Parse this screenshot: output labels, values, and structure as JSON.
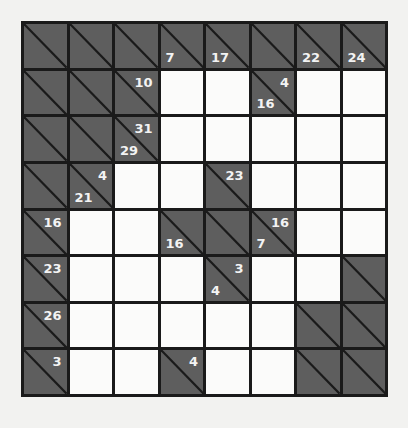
{
  "puzzle": {
    "type": "kakuro",
    "rows": 8,
    "cols": 8,
    "colors": {
      "block": "#5e5e5e",
      "white": "#fbfbfa",
      "grid": "#1a1a1a",
      "clue_text": "#f3f3f3"
    },
    "grid": [
      [
        {
          "t": "block"
        },
        {
          "t": "block"
        },
        {
          "t": "block"
        },
        {
          "t": "block",
          "down": "7"
        },
        {
          "t": "block",
          "down": "17"
        },
        {
          "t": "block"
        },
        {
          "t": "block",
          "down": "22"
        },
        {
          "t": "block",
          "down": "24"
        }
      ],
      [
        {
          "t": "block"
        },
        {
          "t": "block"
        },
        {
          "t": "block",
          "right": "10"
        },
        {
          "t": "white"
        },
        {
          "t": "white"
        },
        {
          "t": "block",
          "right": "4",
          "down": "16"
        },
        {
          "t": "white"
        },
        {
          "t": "white"
        }
      ],
      [
        {
          "t": "block"
        },
        {
          "t": "block"
        },
        {
          "t": "block",
          "right": "31",
          "down": "29"
        },
        {
          "t": "white"
        },
        {
          "t": "white"
        },
        {
          "t": "white"
        },
        {
          "t": "white"
        },
        {
          "t": "white"
        }
      ],
      [
        {
          "t": "block"
        },
        {
          "t": "block",
          "right": "4",
          "down": "21"
        },
        {
          "t": "white"
        },
        {
          "t": "white"
        },
        {
          "t": "block",
          "right": "23"
        },
        {
          "t": "white"
        },
        {
          "t": "white"
        },
        {
          "t": "white"
        }
      ],
      [
        {
          "t": "block",
          "right": "16"
        },
        {
          "t": "white"
        },
        {
          "t": "white"
        },
        {
          "t": "block",
          "down": "16"
        },
        {
          "t": "block"
        },
        {
          "t": "block",
          "right": "16",
          "down": "7"
        },
        {
          "t": "white"
        },
        {
          "t": "white"
        }
      ],
      [
        {
          "t": "block",
          "right": "23"
        },
        {
          "t": "white"
        },
        {
          "t": "white"
        },
        {
          "t": "white"
        },
        {
          "t": "block",
          "right": "3",
          "down": "4"
        },
        {
          "t": "white"
        },
        {
          "t": "white"
        },
        {
          "t": "block"
        }
      ],
      [
        {
          "t": "block",
          "right": "26"
        },
        {
          "t": "white"
        },
        {
          "t": "white"
        },
        {
          "t": "white"
        },
        {
          "t": "white"
        },
        {
          "t": "white"
        },
        {
          "t": "block"
        },
        {
          "t": "block"
        }
      ],
      [
        {
          "t": "block",
          "right": "3"
        },
        {
          "t": "white"
        },
        {
          "t": "white"
        },
        {
          "t": "block",
          "right": "4"
        },
        {
          "t": "white"
        },
        {
          "t": "white"
        },
        {
          "t": "block"
        },
        {
          "t": "block"
        }
      ]
    ]
  }
}
